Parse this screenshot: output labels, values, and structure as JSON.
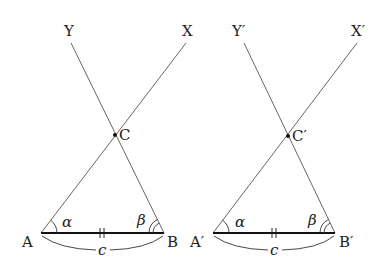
{
  "diagram": {
    "type": "geometry-congruent-triangles-ASA",
    "left_figure": {
      "points": {
        "A": {
          "label": "A",
          "x": 41,
          "y": 233
        },
        "B": {
          "label": "B",
          "x": 164,
          "y": 233
        },
        "C": {
          "label": "C",
          "x": 115,
          "y": 135
        },
        "X": {
          "label": "X",
          "x": 186,
          "y": 43
        },
        "Y": {
          "label": "Y",
          "x": 70,
          "y": 43
        }
      },
      "angle_at_A": "α",
      "angle_at_B": "β",
      "side_AB": "c"
    },
    "right_figure": {
      "points": {
        "A": {
          "label": "A′",
          "x": 213,
          "y": 233
        },
        "B": {
          "label": "B′",
          "x": 335,
          "y": 233
        },
        "C": {
          "label": "C′",
          "x": 288,
          "y": 136
        },
        "X": {
          "label": "X′",
          "x": 358,
          "y": 43
        },
        "Y": {
          "label": "Y′",
          "x": 243,
          "y": 43
        }
      },
      "angle_at_A": "α",
      "angle_at_B": "β",
      "side_AB": "c"
    },
    "colors": {
      "line": "#555555",
      "base": "#111111",
      "text": "#222222"
    }
  }
}
